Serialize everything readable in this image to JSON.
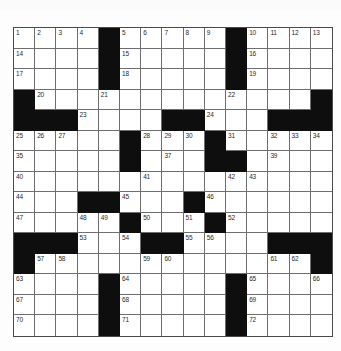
{
  "puzzle": {
    "type": "crossword",
    "rows": 15,
    "cols": 15,
    "colors": {
      "black_cell": "#0e0e0e",
      "white_cell": "#ffffff",
      "grid_line": "#6e6e6e",
      "number_text": "#2a2a2a"
    },
    "layout": [
      "....#.....#....",
      "....#.....#....",
      "....#.....#....",
      "#.............#",
      "###....##...###",
      ".....#...#.....",
      ".....#...##....",
      "...............",
      "...##...#......",
      ".....#...#.....",
      "###...##....###",
      "#.............#",
      "....#.....#....",
      "....#.....#....",
      "....#.....#...."
    ],
    "numbers": {
      "0,0": "1",
      "0,1": "2",
      "0,2": "3",
      "0,3": "4",
      "0,5": "5",
      "0,6": "6",
      "0,7": "7",
      "0,8": "8",
      "0,9": "9",
      "0,11": "10",
      "0,12": "11",
      "0,13": "12",
      "0,14": "13",
      "1,0": "14",
      "1,5": "15",
      "1,11": "16",
      "2,0": "17",
      "2,5": "18",
      "2,11": "19",
      "3,1": "20",
      "3,4": "21",
      "3,10": "22",
      "4,3": "23",
      "4,9": "24",
      "5,0": "25",
      "5,1": "26",
      "5,2": "27",
      "5,6": "28",
      "5,7": "29",
      "5,8": "30",
      "5,10": "31",
      "5,12": "32",
      "5,13": "33",
      "5,14": "34",
      "6,0": "35",
      "6,5": "36",
      "6,7": "37",
      "6,9": "38",
      "6,12": "39",
      "7,0": "40",
      "7,6": "41",
      "7,10": "42",
      "7,11": "43",
      "8,0": "44",
      "8,5": "45",
      "8,9": "46",
      "9,0": "47",
      "9,3": "48",
      "9,4": "49",
      "9,6": "50",
      "9,8": "51",
      "9,10": "52",
      "10,3": "53",
      "10,5": "54",
      "10,8": "55",
      "10,9": "56",
      "11,1": "57",
      "11,2": "58",
      "11,6": "59",
      "11,7": "60",
      "11,12": "61",
      "11,13": "62",
      "12,0": "63",
      "12,5": "64",
      "12,11": "65",
      "12,14": "66",
      "13,0": "67",
      "13,5": "68",
      "13,11": "69",
      "14,0": "70",
      "14,5": "71",
      "14,11": "72"
    }
  }
}
